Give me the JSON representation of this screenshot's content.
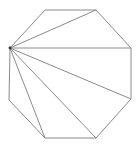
{
  "diagram": {
    "type": "octagon-fan-triangulation",
    "stroke_color": "#8a8a8a",
    "hub_color": "#333333",
    "vertices": [
      [
        10,
        48
      ],
      [
        45,
        10
      ],
      [
        96,
        10
      ],
      [
        131,
        48
      ],
      [
        131,
        99
      ],
      [
        96,
        138
      ],
      [
        45,
        138
      ],
      [
        9,
        100
      ]
    ],
    "hub_index": 0,
    "diagonals_to": [
      2,
      3,
      4,
      5,
      6
    ]
  }
}
